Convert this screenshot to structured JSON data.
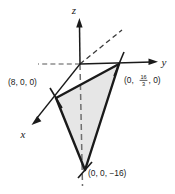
{
  "figure": {
    "background_color": "#ffffff",
    "line_color": "#1a1a1a",
    "fill_color": "#e6e6e6",
    "axes": [
      {
        "name": "x",
        "label": "x",
        "direction": "down-left",
        "dashed_negative": true
      },
      {
        "name": "y",
        "label": "y",
        "direction": "right",
        "dashed_negative": true
      },
      {
        "name": "z",
        "label": "z",
        "direction": "up",
        "dashed_negative": true
      }
    ],
    "vertices": [
      {
        "id": "x-intercept",
        "label": "(8, 0, 0)",
        "axis": "x",
        "value": 8
      },
      {
        "id": "y-intercept",
        "label_prefix": "(0, ",
        "numerator": "16",
        "denominator": "3",
        "label_suffix": ", 0)",
        "axis": "y",
        "value": 5.3333
      },
      {
        "id": "z-intercept",
        "label": "(0, 0, −16)",
        "axis": "z",
        "value": -16
      }
    ]
  }
}
